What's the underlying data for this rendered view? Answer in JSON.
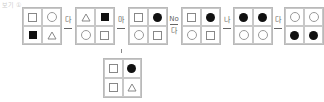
{
  "header_fragment": "보기 ①",
  "grids": [
    {
      "id": "g1",
      "cells": [
        "square-outline",
        "circle-outline",
        "square-filled",
        "triangle-outline"
      ]
    },
    {
      "id": "g2",
      "cells": [
        "triangle-outline",
        "square-filled",
        "circle-outline",
        "square-outline"
      ]
    },
    {
      "id": "g3",
      "cells": [
        "square-outline",
        "circle-filled",
        "circle-outline",
        "square-outline"
      ]
    },
    {
      "id": "g4",
      "cells": [
        "square-outline",
        "circle-filled",
        "circle-outline",
        "square-outline"
      ]
    },
    {
      "id": "g5",
      "cells": [
        "circle-filled",
        "circle-filled",
        "circle-outline",
        "circle-outline"
      ]
    },
    {
      "id": "g6",
      "cells": [
        "circle-outline",
        "circle-outline",
        "circle-filled",
        "circle-filled"
      ]
    },
    {
      "id": "g7",
      "cells": [
        "square-outline",
        "circle-filled",
        "square-outline",
        "triangle-outline"
      ]
    }
  ],
  "operators": [
    {
      "top": "다",
      "bottom": ""
    },
    {
      "top": "마",
      "bottom": ""
    },
    {
      "top": "No",
      "bottom": "다"
    },
    {
      "top": "나",
      "bottom": ""
    },
    {
      "top": "다",
      "bottom": ""
    }
  ]
}
